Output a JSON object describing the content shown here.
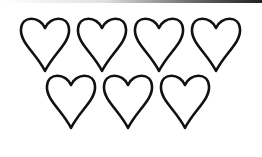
{
  "image": {
    "description": "Seven outlined hearts arranged in two rows (4 on top, 3 below)",
    "stroke_color": "#111111",
    "fill_color": "#ffffff",
    "rows": [
      {
        "count": 4
      },
      {
        "count": 3
      }
    ]
  }
}
